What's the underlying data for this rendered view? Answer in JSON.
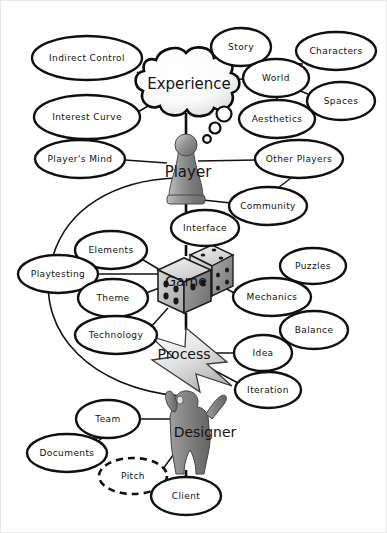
{
  "diagram": {
    "background_color": "#ffffff",
    "stroke_color": "#111111",
    "central_nodes": [
      {
        "id": "experience",
        "label": "Experience",
        "shape": "cloud",
        "x": 189,
        "y": 84
      },
      {
        "id": "player",
        "label": "Player",
        "shape": "pawn",
        "x": 186,
        "y": 177
      },
      {
        "id": "game",
        "label": "Game",
        "shape": "dice",
        "x": 185,
        "y": 281
      },
      {
        "id": "process",
        "label": "Process",
        "shape": "arrow",
        "x": 184,
        "y": 354
      },
      {
        "id": "designer",
        "label": "Designer",
        "shape": "person",
        "x": 205,
        "y": 432
      }
    ],
    "satellite_nodes": [
      {
        "id": "indirect-control",
        "label": "Indirect Control",
        "x": 87,
        "y": 58,
        "rx": 55,
        "ry": 22,
        "dashed": false
      },
      {
        "id": "interest-curve",
        "label": "Interest Curve",
        "x": 87,
        "y": 117,
        "rx": 53,
        "ry": 22,
        "dashed": false
      },
      {
        "id": "story",
        "label": "Story",
        "x": 241,
        "y": 47,
        "rx": 30,
        "ry": 19,
        "dashed": false
      },
      {
        "id": "world",
        "label": "World",
        "x": 276,
        "y": 78,
        "rx": 33,
        "ry": 19,
        "dashed": false
      },
      {
        "id": "characters",
        "label": "Characters",
        "x": 336,
        "y": 51,
        "rx": 40,
        "ry": 19,
        "dashed": false
      },
      {
        "id": "spaces",
        "label": "Spaces",
        "x": 341,
        "y": 101,
        "rx": 34,
        "ry": 19,
        "dashed": false
      },
      {
        "id": "aesthetics",
        "label": "Aesthetics",
        "x": 277,
        "y": 119,
        "rx": 38,
        "ry": 19,
        "dashed": false
      },
      {
        "id": "players-mind",
        "label": "Player's Mind",
        "x": 80,
        "y": 159,
        "rx": 45,
        "ry": 19,
        "dashed": false
      },
      {
        "id": "other-players",
        "label": "Other Players",
        "x": 299,
        "y": 159,
        "rx": 44,
        "ry": 19,
        "dashed": false
      },
      {
        "id": "community",
        "label": "Community",
        "x": 268,
        "y": 206,
        "rx": 39,
        "ry": 19,
        "dashed": false
      },
      {
        "id": "interface",
        "label": "Interface",
        "x": 205,
        "y": 228,
        "rx": 34,
        "ry": 18,
        "dashed": false
      },
      {
        "id": "elements",
        "label": "Elements",
        "x": 111,
        "y": 250,
        "rx": 36,
        "ry": 19,
        "dashed": false
      },
      {
        "id": "playtesting",
        "label": "Playtesting",
        "x": 58,
        "y": 274,
        "rx": 40,
        "ry": 19,
        "dashed": false
      },
      {
        "id": "theme",
        "label": "Theme",
        "x": 113,
        "y": 298,
        "rx": 35,
        "ry": 19,
        "dashed": false
      },
      {
        "id": "technology",
        "label": "Technology",
        "x": 116,
        "y": 335,
        "rx": 41,
        "ry": 19,
        "dashed": false
      },
      {
        "id": "puzzles",
        "label": "Puzzles",
        "x": 313,
        "y": 266,
        "rx": 33,
        "ry": 18,
        "dashed": false
      },
      {
        "id": "mechanics",
        "label": "Mechanics",
        "x": 272,
        "y": 297,
        "rx": 39,
        "ry": 19,
        "dashed": false
      },
      {
        "id": "balance",
        "label": "Balance",
        "x": 314,
        "y": 330,
        "rx": 34,
        "ry": 19,
        "dashed": false
      },
      {
        "id": "idea",
        "label": "Idea",
        "x": 263,
        "y": 353,
        "rx": 29,
        "ry": 18,
        "dashed": false
      },
      {
        "id": "iteration",
        "label": "Iteration",
        "x": 268,
        "y": 390,
        "rx": 33,
        "ry": 18,
        "dashed": false
      },
      {
        "id": "team",
        "label": "Team",
        "x": 108,
        "y": 419,
        "rx": 32,
        "ry": 19,
        "dashed": false
      },
      {
        "id": "documents",
        "label": "Documents",
        "x": 67,
        "y": 453,
        "rx": 40,
        "ry": 19,
        "dashed": false
      },
      {
        "id": "pitch",
        "label": "Pitch",
        "x": 133,
        "y": 476,
        "rx": 34,
        "ry": 18,
        "dashed": true
      },
      {
        "id": "client",
        "label": "Client",
        "x": 186,
        "y": 496,
        "rx": 35,
        "ry": 19,
        "dashed": false
      }
    ],
    "thought_bubbles": [
      {
        "x": 224,
        "y": 114,
        "r": 7.5
      },
      {
        "x": 215,
        "y": 128,
        "r": 5.5
      },
      {
        "x": 207,
        "y": 139,
        "r": 3.8
      }
    ],
    "connections": [
      {
        "from": "indirect-control",
        "to": "experience"
      },
      {
        "from": "interest-curve",
        "to": "experience"
      },
      {
        "from": "experience",
        "to": "world"
      },
      {
        "from": "world",
        "to": "story"
      },
      {
        "from": "world",
        "to": "characters"
      },
      {
        "from": "world",
        "to": "spaces"
      },
      {
        "from": "world",
        "to": "aesthetics"
      },
      {
        "from": "players-mind",
        "to": "player"
      },
      {
        "from": "player",
        "to": "other-players"
      },
      {
        "from": "other-players",
        "to": "community"
      },
      {
        "from": "player",
        "to": "community"
      },
      {
        "from": "player",
        "to": "interface"
      },
      {
        "from": "interface",
        "to": "game"
      },
      {
        "from": "game",
        "to": "elements"
      },
      {
        "from": "game",
        "to": "playtesting"
      },
      {
        "from": "game",
        "to": "theme"
      },
      {
        "from": "game",
        "to": "technology"
      },
      {
        "from": "game",
        "to": "mechanics"
      },
      {
        "from": "mechanics",
        "to": "puzzles"
      },
      {
        "from": "mechanics",
        "to": "balance"
      },
      {
        "from": "game",
        "to": "process"
      },
      {
        "from": "process",
        "to": "idea"
      },
      {
        "from": "process",
        "to": "iteration"
      },
      {
        "from": "process",
        "to": "designer"
      },
      {
        "from": "designer",
        "to": "team"
      },
      {
        "from": "team",
        "to": "documents"
      },
      {
        "from": "designer",
        "to": "pitch"
      },
      {
        "from": "designer",
        "to": "client"
      },
      {
        "from": "pitch",
        "to": "client"
      },
      {
        "from": "player",
        "to": "playtesting",
        "style": "curve"
      }
    ]
  }
}
